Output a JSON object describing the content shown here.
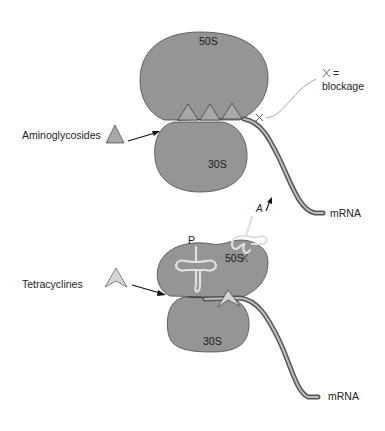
{
  "diagram": {
    "type": "biology-mechanism",
    "colors": {
      "ribosome_fill": "#959595",
      "ribosome_stroke": "#4a4a4a",
      "mrna_outer": "#555555",
      "mrna_inner": "#bdbdbd",
      "drug_fill": "#a8a8a8",
      "tetracycline_fill": "#d6d6d6",
      "trna_stroke": "#d9d9d9"
    },
    "top_panel": {
      "large_subunit": "50S",
      "small_subunit": "30S",
      "drug_label": "Aminoglycosides",
      "drug_icon": "triangle-icon",
      "mrna_label": "mRNA",
      "legend": {
        "symbol": "×",
        "equals": "=",
        "text": "blockage"
      }
    },
    "bottom_panel": {
      "large_subunit": "50S",
      "small_subunit": "30S",
      "drug_label": "Tetracyclines",
      "drug_icon": "arrowhead-icon",
      "mrna_label": "mRNA",
      "p_site_label": "P",
      "a_site_label": "A",
      "blockage_mark": "×"
    }
  }
}
